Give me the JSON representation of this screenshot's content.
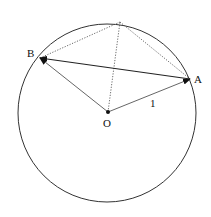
{
  "diagram": {
    "type": "geometry",
    "circle": {
      "center": "O",
      "cx": 107,
      "cy": 113,
      "r": 89
    },
    "points": {
      "O": {
        "label": "O",
        "x": 108,
        "y": 112
      },
      "A": {
        "label": "A",
        "x": 190,
        "y": 79
      },
      "B": {
        "label": "B",
        "x": 40,
        "y": 58
      },
      "C": {
        "label": "",
        "x": 120,
        "y": 22
      }
    },
    "segments": [
      {
        "from": "O",
        "to": "A",
        "style": "arrow",
        "label": "1"
      },
      {
        "from": "O",
        "to": "B",
        "style": "arrow"
      },
      {
        "from": "A",
        "to": "B",
        "style": "arrow"
      },
      {
        "from": "B",
        "to": "C",
        "style": "dotted"
      },
      {
        "from": "C",
        "to": "A",
        "style": "dotted"
      },
      {
        "from": "O",
        "to": "C",
        "style": "dotted"
      }
    ],
    "labels": {
      "O": "O",
      "A": "A",
      "B": "B",
      "radius": "1"
    },
    "colors": {
      "stroke": "#222222",
      "background": "#ffffff"
    }
  }
}
